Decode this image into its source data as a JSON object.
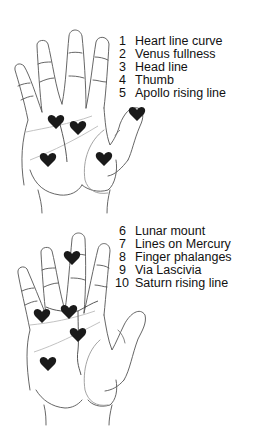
{
  "diagrams": [
    {
      "title": "Palm diagram 1",
      "legend": [
        {
          "num": "1",
          "label": "Heart line curve"
        },
        {
          "num": "2",
          "label": "Venus fullness"
        },
        {
          "num": "3",
          "label": "Head line"
        },
        {
          "num": "4",
          "label": "Thumb"
        },
        {
          "num": "5",
          "label": "Apollo rising line"
        }
      ],
      "marker_icon": "heart-icon",
      "marker_count": 5
    },
    {
      "title": "Palm diagram 2",
      "legend": [
        {
          "num": "6",
          "label": "Lunar mount"
        },
        {
          "num": "7",
          "label": "Lines on Mercury"
        },
        {
          "num": "8",
          "label": "Finger phalanges"
        },
        {
          "num": "9",
          "label": "Via Lascivia"
        },
        {
          "num": "10",
          "label": "Saturn rising line"
        }
      ],
      "marker_icon": "heart-icon",
      "marker_count": 5
    }
  ],
  "colors": {
    "outline": "#555555",
    "palm_lines": "#bbbbbb",
    "marker": "#1a1a1a",
    "text": "#111111"
  }
}
